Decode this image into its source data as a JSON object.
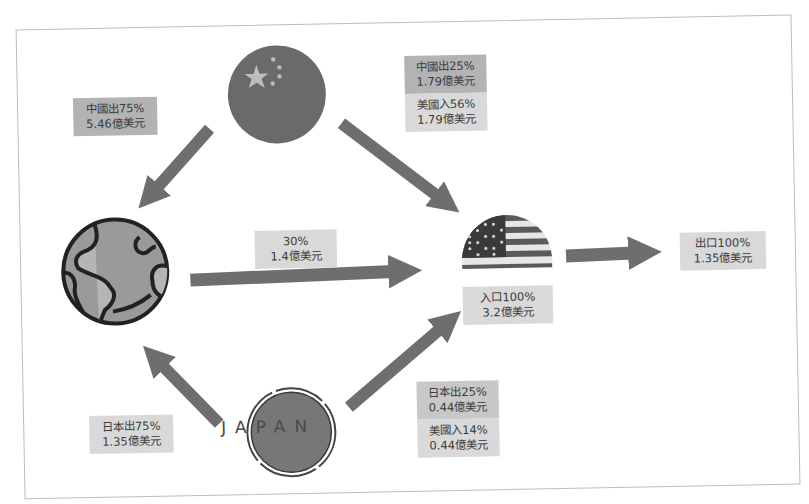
{
  "diagram": {
    "title": "",
    "nodes": {
      "china": {
        "name": "China flag",
        "icon": "china-flag-icon"
      },
      "world": {
        "name": "World globe",
        "icon": "globe-icon"
      },
      "usa": {
        "name": "USA flag",
        "icon": "usa-flag-icon"
      },
      "japan": {
        "name": "Japan",
        "icon": "japan-badge-icon",
        "text": "JAPAN"
      }
    },
    "labels": {
      "china_to_world": {
        "line1": "中國出75%",
        "line2": "5.46億美元"
      },
      "china_to_usa_export": {
        "line1": "中國出25%",
        "line2": "1.79億美元"
      },
      "china_to_usa_import": {
        "line1": "美國入56%",
        "line2": "1.79億美元"
      },
      "world_to_usa": {
        "line1": "30%",
        "line2": "1.4億美元"
      },
      "usa_import": {
        "line1": "入口100%",
        "line2": "3.2億美元"
      },
      "usa_export": {
        "line1": "出口100%",
        "line2": "1.35億美元"
      },
      "japan_to_world": {
        "line1": "日本出75%",
        "line2": "1.35億美元"
      },
      "japan_to_usa_export": {
        "line1": "日本出25%",
        "line2": "0.44億美元"
      },
      "japan_to_usa_import": {
        "line1": "美國入14%",
        "line2": "0.44億美元"
      }
    },
    "edges": [
      {
        "from": "china",
        "to": "world",
        "label": "中國出75% 5.46億美元"
      },
      {
        "from": "china",
        "to": "usa",
        "label": "中國出25% 1.79億美元 / 美國入56% 1.79億美元"
      },
      {
        "from": "world",
        "to": "usa",
        "label": "30% 1.4億美元"
      },
      {
        "from": "japan",
        "to": "world",
        "label": "日本出75% 1.35億美元"
      },
      {
        "from": "japan",
        "to": "usa",
        "label": "日本出25% 0.44億美元 / 美國入14% 0.44億美元"
      },
      {
        "from": "usa",
        "to": "export",
        "label": "出口100% 1.35億美元"
      }
    ],
    "colors": {
      "arrow": "#6e6e6e",
      "label_dark": "#b3b3b3",
      "label_light": "#d9d9d9",
      "flag_fill": "#6a6a6a",
      "frame_border": "#bdbdbd"
    }
  }
}
